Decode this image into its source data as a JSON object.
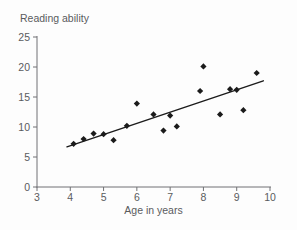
{
  "chart_data": {
    "type": "scatter",
    "title": "Reading ability",
    "xlabel": "Age in years",
    "ylabel": "Reading ability",
    "xlim": [
      3,
      10
    ],
    "ylim": [
      0,
      25
    ],
    "x_ticks": [
      3,
      4,
      5,
      6,
      7,
      8,
      9,
      10
    ],
    "y_ticks": [
      0,
      5,
      10,
      15,
      20,
      25
    ],
    "grid": false,
    "legend": null,
    "points": [
      [
        4.1,
        7.2
      ],
      [
        4.4,
        8.0
      ],
      [
        4.7,
        8.9
      ],
      [
        5.0,
        8.8
      ],
      [
        5.3,
        7.8
      ],
      [
        5.7,
        10.2
      ],
      [
        6.0,
        13.9
      ],
      [
        6.5,
        12.1
      ],
      [
        6.8,
        9.4
      ],
      [
        7.0,
        11.9
      ],
      [
        7.2,
        10.1
      ],
      [
        7.9,
        16.0
      ],
      [
        8.0,
        20.1
      ],
      [
        8.5,
        12.1
      ],
      [
        8.8,
        16.3
      ],
      [
        9.0,
        16.2
      ],
      [
        9.2,
        12.8
      ],
      [
        9.6,
        19.0
      ]
    ],
    "trend_line": {
      "x1": 3.9,
      "y1": 6.7,
      "x2": 9.8,
      "y2": 17.7
    }
  },
  "colors": {
    "background": "#fdfdfd",
    "text": "#5a5b5d",
    "axis": "#707174",
    "marker": "#1b1b1b",
    "trend": "#1b1b1b"
  }
}
